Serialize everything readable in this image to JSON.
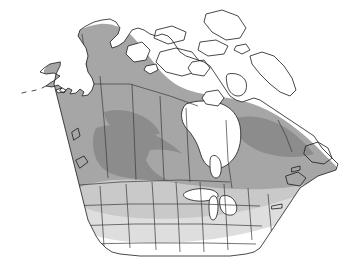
{
  "figure": {
    "kind": "distribution-range-map",
    "region": "North America (Canada, United States, Alaska)",
    "projection_hint": "conic",
    "background_color": "#ffffff",
    "outline_color": "#1a1a1a",
    "internal_border_color": "#3a3a3a",
    "title": "",
    "caption": "",
    "legend_present": false,
    "labels_present": false
  },
  "shading": {
    "levels": [
      {
        "id": "core",
        "label": "",
        "color": "#8c8c8c",
        "description": "darkest core zone over central prairie / southern boreal interior"
      },
      {
        "id": "main",
        "label": "",
        "color": "#a6a6a6",
        "description": "main range across Alaska, Yukon, boreal Canada, Quebec, Labrador, Newfoundland, northern United States"
      },
      {
        "id": "transition",
        "label": "",
        "color": "#c9c9c9",
        "description": "lighter transitional band across southern Canada and the northern United States"
      },
      {
        "id": "fringe",
        "label": "",
        "color": "#dedede",
        "description": "faintest outer fringe across the central and western United States"
      },
      {
        "id": "absent",
        "label": "",
        "color": "#ffffff",
        "description": "unshaded: Arctic archipelago, Hudson Bay, Great Lakes, southern and southwestern United States"
      }
    ]
  },
  "features": {
    "water_bodies": [
      {
        "name": "Hudson Bay",
        "shaded": false
      },
      {
        "name": "James Bay",
        "shaded": false
      },
      {
        "name": "Great Lakes",
        "shaded": false
      },
      {
        "name": "Foxe Basin",
        "shaded": false
      },
      {
        "name": "Gulf of Alaska",
        "shaded": false
      }
    ],
    "unshaded_land": [
      {
        "name": "Canadian Arctic Archipelago"
      },
      {
        "name": "Baffin Island"
      },
      {
        "name": "Victoria Island"
      },
      {
        "name": "Banks Island"
      },
      {
        "name": "Ellesmere Island"
      },
      {
        "name": "Southwestern United States"
      },
      {
        "name": "Southeastern United States"
      }
    ],
    "shaded_land": [
      {
        "name": "Alaska",
        "level": "main"
      },
      {
        "name": "Yukon",
        "level": "main"
      },
      {
        "name": "Northwest Territories",
        "level": "main"
      },
      {
        "name": "British Columbia",
        "level": "main"
      },
      {
        "name": "Alberta",
        "level": "core"
      },
      {
        "name": "Saskatchewan",
        "level": "core"
      },
      {
        "name": "Manitoba",
        "level": "main"
      },
      {
        "name": "Ontario",
        "level": "main"
      },
      {
        "name": "Quebec",
        "level": "main"
      },
      {
        "name": "Labrador",
        "level": "main"
      },
      {
        "name": "Newfoundland",
        "level": "main"
      },
      {
        "name": "Maritimes",
        "level": "main"
      },
      {
        "name": "Northern United States",
        "level": "transition"
      },
      {
        "name": "Great Plains",
        "level": "fringe"
      }
    ]
  }
}
